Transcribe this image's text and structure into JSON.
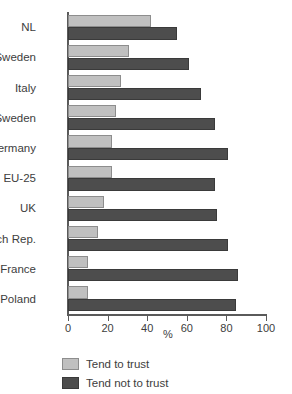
{
  "chart_data": {
    "type": "bar",
    "orientation": "horizontal",
    "title": "",
    "xlabel": "%",
    "ylabel": "",
    "xlim": [
      0,
      100
    ],
    "xticks": [
      0,
      20,
      40,
      60,
      80,
      100
    ],
    "grid": false,
    "legend_position": "bottom-left",
    "categories": [
      "NL",
      "Sweden",
      "Italy",
      "Sweden",
      "Germany",
      "EU-25",
      "UK",
      "Czch Rep.",
      "France",
      "Poland"
    ],
    "series": [
      {
        "name": "Tend to trust",
        "color": "#c0c0c0",
        "values": [
          42,
          31,
          27,
          24,
          22,
          22,
          18,
          15,
          10,
          10
        ]
      },
      {
        "name": "Tend not to trust",
        "color": "#4d4d4d",
        "values": [
          55,
          61,
          67,
          74,
          81,
          74,
          75,
          81,
          86,
          85
        ]
      }
    ]
  },
  "axis": {
    "x_title": "%",
    "tick_labels": [
      "0",
      "20",
      "40",
      "60",
      "80",
      "100"
    ]
  },
  "legend": {
    "items": [
      {
        "label": "Tend to trust",
        "swatch": "light"
      },
      {
        "label": "Tend not to trust",
        "swatch": "dark"
      }
    ]
  },
  "colors": {
    "light_bar": "#c0c0c0",
    "dark_bar": "#4d4d4d",
    "axis": "#5a5a5a",
    "text": "#3d3d3d",
    "background": "#ffffff"
  }
}
